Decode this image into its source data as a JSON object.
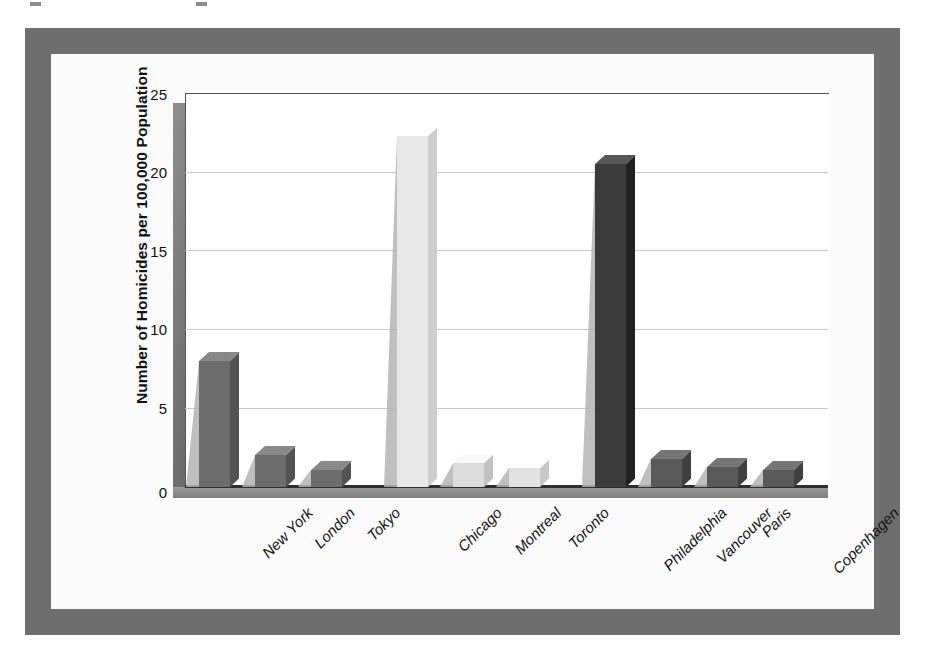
{
  "chart_data": {
    "type": "bar",
    "title": "",
    "xlabel": "",
    "ylabel": "Number of Homicides per 100,000 Population",
    "ylim": [
      0,
      25
    ],
    "yticks": [
      25,
      20,
      15,
      10,
      5,
      0
    ],
    "grid": true,
    "legend": "none",
    "style": "3d-column",
    "categories": [
      "New York",
      "London",
      "Tokyo",
      "Chicago",
      "Montreal",
      "Toronto",
      "Philadelphia",
      "Vancouver",
      "Paris",
      "Copenhagen"
    ],
    "values": [
      8.0,
      2.0,
      1.1,
      22.3,
      1.5,
      1.2,
      20.5,
      1.8,
      1.3,
      1.1
    ],
    "bar_colors": [
      "#6d6d6d",
      "#6d6d6d",
      "#6d6d6d",
      "#e8e8e8",
      "#dcdcdc",
      "#e2e2e2",
      "#3b3b3b",
      "#5a5a5a",
      "#5a5a5a",
      "#5a5a5a"
    ],
    "group_gaps_after": [
      "Tokyo",
      "Toronto"
    ]
  },
  "axis": {
    "y_title": "Number of Homicides per 100,000 Population",
    "tick_25": "25",
    "tick_20": "20",
    "tick_15": "15",
    "tick_10": "10",
    "tick_5": "5",
    "tick_0": "0"
  },
  "labels": {
    "c0": "New York",
    "c1": "London",
    "c2": "Tokyo",
    "c3": "Chicago",
    "c4": "Montreal",
    "c5": "Toronto",
    "c6": "Philadelphia",
    "c7": "Vancouver",
    "c8": "Paris",
    "c9": "Copenhagen"
  },
  "colors": {
    "frame": "#6e6e6e",
    "page_background": "#ffffff",
    "plot_background": "#fbfbfb",
    "gridline": "#c9c9c9",
    "axis_line": "#2e2e2e"
  }
}
